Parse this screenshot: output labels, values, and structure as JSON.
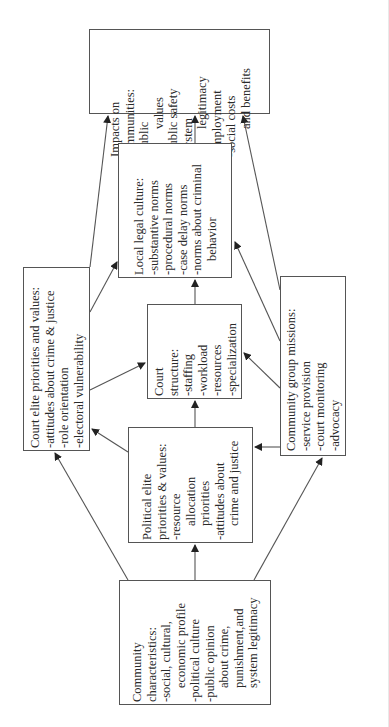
{
  "diagram": {
    "orientation": "rotated -90deg (text reads bottom-to-top)",
    "nodes": {
      "community_characteristics": {
        "title": "Community",
        "lines": [
          "Community",
          "characteristics:",
          "-social, cultural,",
          "economic profile",
          "-political culture",
          "-public opinion",
          "about crime,",
          "punishment,and",
          "system legitimacy"
        ]
      },
      "political_elite": {
        "lines": [
          "Political elite",
          "priorities & values:",
          "-resource",
          "allocation",
          "priorities",
          "-attitudes about",
          "crime and justice"
        ]
      },
      "court_elite": {
        "lines": [
          "Court elite priorities and values:",
          "-attitudes about crime & justice",
          "-role orientation",
          "-electoral vulnerability"
        ]
      },
      "court_structure": {
        "lines": [
          "Court",
          "structure:",
          "-staffing",
          "-workload",
          "-resources",
          "-specialization"
        ]
      },
      "community_group_missions": {
        "lines": [
          "Community group missions:",
          "-service provision",
          "-court monitoring",
          "-advocacy"
        ]
      },
      "local_legal_culture": {
        "lines": [
          "Local legal culture:",
          "-substantive norms",
          "-procedural norms",
          "-case delay norms",
          "-norms about criminal",
          "behavior"
        ]
      },
      "impacts": {
        "lines": [
          "Impacts on",
          "communities:",
          "-public",
          "values",
          "-public safety",
          "-system",
          "legitimacy",
          "-employment",
          "-social costs",
          "and benefits"
        ]
      }
    },
    "edges": [
      {
        "from": "community_characteristics",
        "to": "political_elite"
      },
      {
        "from": "community_characteristics",
        "to": "court_elite"
      },
      {
        "from": "community_characteristics",
        "to": "community_group_missions"
      },
      {
        "from": "political_elite",
        "to": "court_structure"
      },
      {
        "from": "political_elite",
        "to": "court_elite"
      },
      {
        "from": "community_group_missions",
        "to": "political_elite"
      },
      {
        "from": "community_group_missions",
        "to": "court_structure"
      },
      {
        "from": "community_group_missions",
        "to": "local_legal_culture"
      },
      {
        "from": "community_group_missions",
        "to": "impacts"
      },
      {
        "from": "court_elite",
        "to": "court_structure"
      },
      {
        "from": "court_elite",
        "to": "local_legal_culture"
      },
      {
        "from": "court_elite",
        "to": "impacts"
      },
      {
        "from": "court_structure",
        "to": "local_legal_culture"
      },
      {
        "from": "local_legal_culture",
        "to": "impacts"
      }
    ]
  }
}
